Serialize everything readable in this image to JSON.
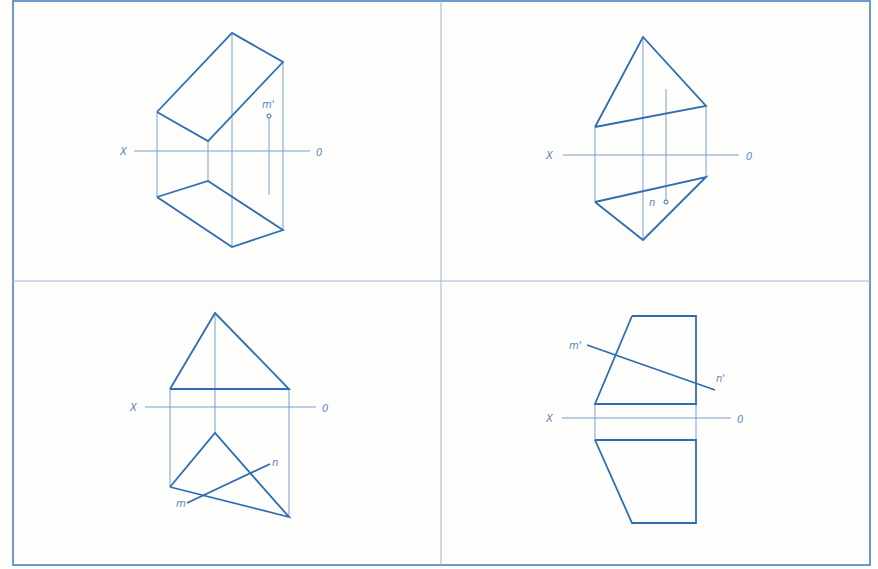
{
  "colors": {
    "background": "#fdfdfb",
    "frame": "#4a7fbf",
    "divider": "#9cb7d6",
    "outline": "#2f6db3",
    "projection": "#6c94c7",
    "label": "#5a86bd"
  },
  "frame": {
    "x": 13,
    "y": 1,
    "width": 857,
    "height": 564,
    "mid_x": 441,
    "mid_y": 281
  },
  "panels": [
    {
      "id": "top-left",
      "axis": {
        "x1": 134,
        "x2": 310,
        "y": 151,
        "label_x": "X",
        "label_o": "0",
        "label_x_pos": [
          120,
          155
        ],
        "label_o_pos": [
          316,
          156
        ]
      },
      "thick_lines": [
        [
          [
            157,
            112
          ],
          [
            232,
            33
          ],
          [
            283,
            62
          ],
          [
            208,
            141
          ],
          [
            157,
            112
          ]
        ],
        [
          [
            157,
            197
          ],
          [
            208,
            181
          ],
          [
            283,
            230
          ],
          [
            232,
            247
          ],
          [
            157,
            197
          ]
        ]
      ],
      "thin_lines": [
        [
          [
            157,
            112
          ],
          [
            157,
            197
          ]
        ],
        [
          [
            232,
            33
          ],
          [
            232,
            247
          ]
        ],
        [
          [
            283,
            62
          ],
          [
            283,
            230
          ]
        ],
        [
          [
            208,
            141
          ],
          [
            208,
            181
          ]
        ],
        [
          [
            269,
            118
          ],
          [
            269,
            195
          ]
        ]
      ],
      "points": [
        {
          "name": "m'",
          "x": 269,
          "y": 116,
          "label_pos": [
            262,
            108
          ]
        }
      ]
    },
    {
      "id": "top-right",
      "axis": {
        "x1": 563,
        "x2": 739,
        "y": 155,
        "label_x": "X",
        "label_o": "0",
        "label_x_pos": [
          546,
          159
        ],
        "label_o_pos": [
          746,
          160
        ]
      },
      "thick_lines": [
        [
          [
            595,
            127
          ],
          [
            643,
            37
          ],
          [
            706,
            106
          ],
          [
            595,
            127
          ]
        ],
        [
          [
            595,
            202
          ],
          [
            706,
            177
          ],
          [
            643,
            240
          ],
          [
            595,
            202
          ]
        ]
      ],
      "thin_lines": [
        [
          [
            595,
            127
          ],
          [
            595,
            202
          ]
        ],
        [
          [
            643,
            37
          ],
          [
            643,
            240
          ]
        ],
        [
          [
            706,
            106
          ],
          [
            706,
            177
          ]
        ],
        [
          [
            666,
            89
          ],
          [
            666,
            201
          ]
        ]
      ],
      "points": [
        {
          "name": "n",
          "x": 666,
          "y": 202,
          "label_pos": [
            649,
            206
          ]
        }
      ]
    },
    {
      "id": "bottom-left",
      "axis": {
        "x1": 145,
        "x2": 316,
        "y": 407,
        "label_x": "X",
        "label_o": "0",
        "label_x_pos": [
          130,
          411
        ],
        "label_o_pos": [
          322,
          412
        ]
      },
      "thick_lines": [
        [
          [
            170,
            389
          ],
          [
            215,
            313
          ],
          [
            289,
            389
          ],
          [
            170,
            389
          ]
        ],
        [
          [
            170,
            487
          ],
          [
            215,
            433
          ],
          [
            289,
            517
          ],
          [
            170,
            487
          ]
        ],
        [
          [
            187,
            503
          ],
          [
            270,
            464
          ]
        ]
      ],
      "thin_lines": [
        [
          [
            170,
            389
          ],
          [
            170,
            487
          ]
        ],
        [
          [
            215,
            313
          ],
          [
            215,
            433
          ]
        ],
        [
          [
            289,
            389
          ],
          [
            289,
            517
          ]
        ]
      ],
      "points": [],
      "labels": [
        {
          "text": "n",
          "pos": [
            272,
            466
          ]
        },
        {
          "text": "m",
          "pos": [
            176,
            507
          ]
        }
      ]
    },
    {
      "id": "bottom-right",
      "axis": {
        "x1": 562,
        "x2": 731,
        "y": 418,
        "label_x": "X",
        "label_o": "0",
        "label_x_pos": [
          546,
          422
        ],
        "label_o_pos": [
          737,
          423
        ]
      },
      "thick_lines": [
        [
          [
            632,
            316
          ],
          [
            696,
            316
          ],
          [
            696,
            404
          ],
          [
            595,
            404
          ],
          [
            632,
            316
          ]
        ],
        [
          [
            595,
            440
          ],
          [
            696,
            440
          ],
          [
            696,
            523
          ],
          [
            632,
            523
          ],
          [
            595,
            440
          ]
        ],
        [
          [
            587,
            345
          ],
          [
            715,
            390
          ]
        ]
      ],
      "thin_lines": [
        [
          [
            595,
            404
          ],
          [
            595,
            440
          ]
        ],
        [
          [
            696,
            404
          ],
          [
            696,
            440
          ]
        ]
      ],
      "points": [],
      "labels": [
        {
          "text": "m'",
          "pos": [
            569,
            349
          ]
        },
        {
          "text": "n'",
          "pos": [
            716,
            382
          ]
        }
      ]
    }
  ]
}
